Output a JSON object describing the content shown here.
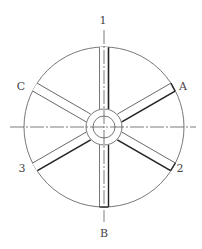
{
  "diagram": {
    "title": "",
    "type": "wheel-with-six-spokes",
    "labels": {
      "top": "1",
      "bottom": "B",
      "upper_left": "C",
      "upper_right": "A",
      "lower_left": "3",
      "lower_right": "2"
    },
    "geometry": {
      "center": [
        104,
        127
      ],
      "outer_radius": 80,
      "hub_outer_radius": 18,
      "hub_inner_radius": 11,
      "spoke_width": 9,
      "spoke_angles_deg": [
        90,
        30,
        -30,
        -90,
        -150,
        150
      ]
    },
    "colors": {
      "line": "#555555",
      "thick_line": "#222222",
      "background": "#ffffff"
    }
  }
}
